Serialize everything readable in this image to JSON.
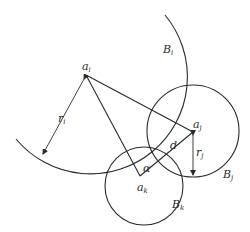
{
  "diagram": {
    "stroke_color": "#2a2a2a",
    "background": "#ffffff",
    "points": {
      "a_i": {
        "label": "a",
        "sub": "i",
        "x": 86,
        "y": 75
      },
      "a_j": {
        "label": "a",
        "sub": "j",
        "x": 193,
        "y": 132
      },
      "a_k": {
        "label": "a",
        "sub": "k",
        "x": 140,
        "y": 176
      }
    },
    "regions": {
      "B_i": {
        "label": "B",
        "sub": "i"
      },
      "B_j": {
        "label": "B",
        "sub": "j"
      },
      "B_k": {
        "label": "B",
        "sub": "k"
      }
    },
    "radii": {
      "r_i": {
        "label": "r",
        "sub": "i"
      },
      "r_j": {
        "label": "r",
        "sub": "j"
      }
    },
    "distance_label": "d",
    "angle_label": "α"
  }
}
